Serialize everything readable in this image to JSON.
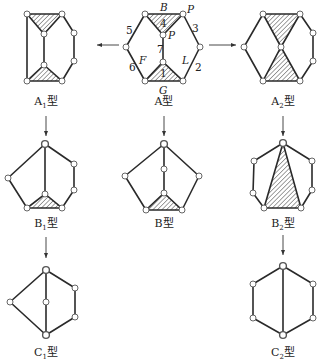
{
  "diagram": {
    "type": "mechanism-topology-derivation",
    "source_graph": {
      "caption": "A型",
      "edge_labels": [
        "1",
        "2",
        "3",
        "4",
        "5",
        "6",
        "7"
      ],
      "node_labels": [
        "B",
        "P",
        "P",
        "F",
        "L",
        "G"
      ]
    },
    "captions": {
      "A": {
        "base": "A",
        "sub": "",
        "suffix": "型"
      },
      "A1": {
        "base": "A",
        "sub": "1",
        "suffix": "型"
      },
      "A2": {
        "base": "A",
        "sub": "2",
        "suffix": "型"
      },
      "B": {
        "base": "B",
        "sub": "",
        "suffix": "型"
      },
      "B1": {
        "base": "B",
        "sub": "1",
        "suffix": "型"
      },
      "B2": {
        "base": "B",
        "sub": "2",
        "suffix": "型"
      },
      "C1": {
        "base": "C",
        "sub": "1",
        "suffix": "型"
      },
      "C2": {
        "base": "C",
        "sub": "2",
        "suffix": "型"
      }
    },
    "labels": {
      "B": "B",
      "P_top": "P",
      "P_inner": "P",
      "F": "F",
      "L": "L",
      "G": "G",
      "n1": "1",
      "n2": "2",
      "n3": "3",
      "n4": "4",
      "n5": "5",
      "n6": "6",
      "n7": "7"
    },
    "arrows": [
      {
        "from": "A",
        "to": "A1",
        "direction": "left"
      },
      {
        "from": "A",
        "to": "A2",
        "direction": "right"
      },
      {
        "from": "A1",
        "to": "B1",
        "direction": "down"
      },
      {
        "from": "A",
        "to": "B",
        "direction": "down"
      },
      {
        "from": "A2",
        "to": "B2",
        "direction": "down"
      },
      {
        "from": "B1",
        "to": "C1",
        "direction": "down"
      },
      {
        "from": "B2",
        "to": "C2",
        "direction": "down"
      }
    ],
    "colors": {
      "line": "#2a2a2a",
      "hatch": "#444444",
      "node_fill": "#ffffff",
      "background": "#ffffff"
    }
  }
}
